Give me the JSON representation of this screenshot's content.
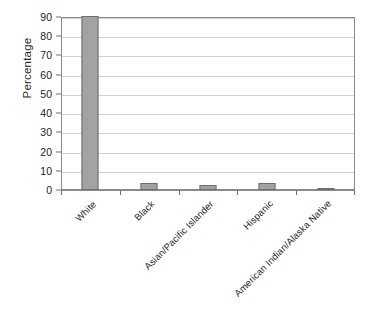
{
  "chart_data": {
    "type": "bar",
    "title": "",
    "xlabel": "",
    "ylabel": "Percentage",
    "categories": [
      "White",
      "Black",
      "Asian/Pacific Islander",
      "Hispanic",
      "American Indian/Alaska Native"
    ],
    "values": [
      90.5,
      3.5,
      2.5,
      3.7,
      0.5
    ],
    "ylim": [
      0,
      90
    ],
    "yticks": [
      0,
      10,
      20,
      30,
      40,
      50,
      60,
      70,
      80,
      90
    ],
    "ytick_labels": [
      "0",
      "10",
      "20",
      "30",
      "40",
      "50",
      "60",
      "70",
      "80",
      "90"
    ],
    "grid": true,
    "grid_axis": "y",
    "legend": false,
    "bar_color": "#a3a3a3",
    "bar_border_color": "#6e6e6e",
    "gridline_color": "#d2d2d2",
    "axis_color": "#8a8a8a",
    "background_color": "#ffffff",
    "xtick_label_rotation": -45
  }
}
